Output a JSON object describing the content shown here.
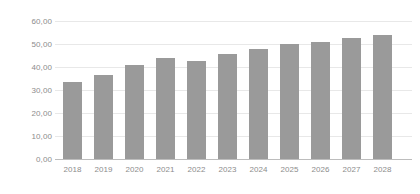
{
  "chart_data": {
    "type": "bar",
    "title": "",
    "subtitle": "",
    "xlabel": "",
    "ylabel": "",
    "categories": [
      "2018",
      "2019",
      "2020",
      "2021",
      "2022",
      "2023",
      "2024",
      "2025",
      "2026",
      "2027",
      "2028"
    ],
    "values": [
      33.5,
      36.5,
      41.0,
      44.0,
      42.5,
      45.5,
      48.0,
      50.0,
      51.0,
      52.5,
      54.0
    ],
    "ylim": [
      0,
      60
    ],
    "ytick_values": [
      0,
      10,
      20,
      30,
      40,
      50,
      60
    ],
    "ytick_labels": [
      "0,00",
      "10,00",
      "20,00",
      "30,00",
      "40,00",
      "50,00",
      "60,00"
    ],
    "grid": true,
    "grid_axis": "y",
    "legend": false,
    "legend_position": "none",
    "annotations": [],
    "decimal_separator": ",",
    "bar_color": "#9a9a9a",
    "grid_color": "#e8e8e8",
    "axis_color": "#bdbdbd",
    "tick_label_color": "#8c8c8c",
    "background_color": "#ffffff"
  }
}
